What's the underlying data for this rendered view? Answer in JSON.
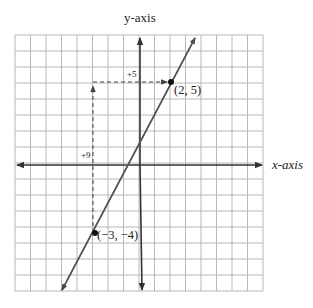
{
  "labels": {
    "y_axis": "y-axis",
    "x_axis": "x-axis",
    "point_a": "(2, 5)",
    "point_b": "(−3, −4)",
    "run": "+5",
    "rise": "+9"
  },
  "chart_data": {
    "type": "line",
    "title": "",
    "xlabel": "x-axis",
    "ylabel": "y-axis",
    "grid": true,
    "xlim": [
      -8,
      8
    ],
    "ylim": [
      -8,
      8
    ],
    "points": [
      {
        "x": 2,
        "y": 5,
        "label": "(2, 5)"
      },
      {
        "x": -3,
        "y": -4,
        "label": "(−3, −4)"
      }
    ],
    "line": {
      "slope": 1.8,
      "passes_through": [
        [
          -3,
          -4
        ],
        [
          2,
          5
        ]
      ]
    },
    "annotations": [
      {
        "text": "+9",
        "type": "rise",
        "from": [
          -3,
          -4
        ],
        "to": [
          -3,
          5
        ]
      },
      {
        "text": "+5",
        "type": "run",
        "from": [
          -3,
          5
        ],
        "to": [
          2,
          5
        ]
      }
    ]
  },
  "colors": {
    "grid": "#b8b8b8",
    "axis": "#333333",
    "line": "#555555",
    "point": "#111111"
  }
}
